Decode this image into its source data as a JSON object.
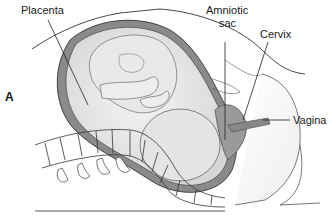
{
  "figure": {
    "panel_letter": "A",
    "labels": {
      "placenta": "Placenta",
      "amniotic_sac_line1": "Amniotic",
      "amniotic_sac_line2": "sac",
      "cervix": "Cervix",
      "vagina": "Vagina"
    },
    "colors": {
      "line": "#333333",
      "uterine_wall": "#8a8a8a",
      "fetus_fill": "#e6e6e6",
      "tissue_fill": "#d4d4d4",
      "background": "#ffffff"
    }
  }
}
